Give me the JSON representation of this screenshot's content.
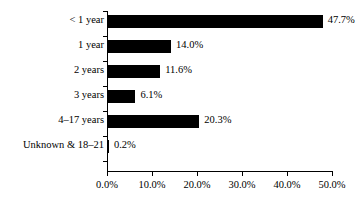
{
  "chart_data": {
    "type": "bar",
    "orientation": "horizontal",
    "title": "",
    "subtitle": "",
    "xlabel": "",
    "ylabel": "",
    "categories": [
      "< 1 year",
      "1 year",
      "2 years",
      "3 years",
      "4–17 years",
      "Unknown & 18–21"
    ],
    "values": [
      47.7,
      14.0,
      11.6,
      6.1,
      20.3,
      0.2
    ],
    "value_labels": [
      "47.7%",
      "14.0%",
      "11.6%",
      "6.1%",
      "20.3%",
      "0.2%"
    ],
    "xlim": [
      0,
      50
    ],
    "x_ticks": [
      0,
      10,
      20,
      30,
      40,
      50
    ],
    "x_tick_labels": [
      "0.0%",
      "10.0%",
      "20.0%",
      "30.0%",
      "40.0%",
      "50.0%"
    ],
    "grid": false,
    "legend": null,
    "bar_color": "#000000",
    "background_color": "#ffffff",
    "axis_color": "#000000"
  }
}
